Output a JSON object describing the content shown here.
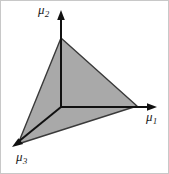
{
  "figure": {
    "kind": "3d-simplex-diagram",
    "background_color": "#ffffff",
    "border_color": "#c8c8c8",
    "width": 169,
    "height": 174
  },
  "simplex": {
    "name": "probability-simplex-triangle",
    "fill_color": "#a9a9a9",
    "stroke_color": "#3a3a3a",
    "stroke_width": 1.4,
    "vertices": [
      {
        "name": "mu2-vertex",
        "x": 61,
        "y": 38
      },
      {
        "name": "mu1-vertex",
        "x": 137,
        "y": 106
      },
      {
        "name": "mu3-vertex",
        "x": 18,
        "y": 144
      }
    ],
    "points_attr": "61,38 137,106 18,144"
  },
  "origin": {
    "x": 61,
    "y": 107
  },
  "axes": [
    {
      "id": "mu2",
      "name": "axis-mu2",
      "label": "μ",
      "subscript": "2",
      "direction": "up",
      "color": "#111111",
      "stroke_width": 2,
      "line": {
        "x1": 61,
        "y1": 107,
        "x2": 61,
        "y2": 17
      },
      "arrow_points": "61,10 57.2,20 64.8,20"
    },
    {
      "id": "mu1",
      "name": "axis-mu1",
      "label": "μ",
      "subscript": "1",
      "direction": "right",
      "color": "#111111",
      "stroke_width": 2,
      "line": {
        "x1": 61,
        "y1": 107,
        "x2": 150,
        "y2": 107
      },
      "arrow_points": "157,107 147,103.2 147,110.8"
    },
    {
      "id": "mu3",
      "name": "axis-mu3",
      "label": "μ",
      "subscript": "3",
      "direction": "down-left",
      "color": "#111111",
      "stroke_width": 2,
      "line": {
        "x1": 61,
        "y1": 107,
        "x2": 18,
        "y2": 142
      },
      "arrow_points": "12,147 23.2,144.1 18.4,138.2"
    }
  ],
  "labels": {
    "mu1": {
      "glyph": "μ",
      "sub": "1"
    },
    "mu2": {
      "glyph": "μ",
      "sub": "2"
    },
    "mu3": {
      "glyph": "μ",
      "sub": "3"
    }
  }
}
